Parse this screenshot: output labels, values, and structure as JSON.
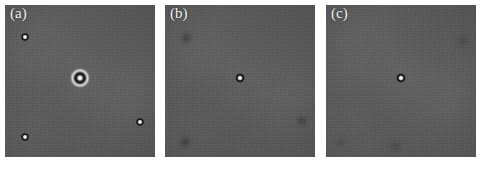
{
  "figure": {
    "type": "micrograph-panel-series",
    "background_color": "#ffffff",
    "panel_count": 3,
    "panel_background_color": "#5b5b5b",
    "label_color": "#f2f2f2"
  },
  "panels": [
    {
      "id": "a",
      "label": "(a)",
      "x": 5,
      "y": 5,
      "width": 150,
      "height": 152,
      "background_color": "#5b5b5b",
      "features": [
        {
          "name": "central-halo-particle",
          "kind": "halo-particle",
          "cx_pct": 50.0,
          "cy_pct": 48.0,
          "size": 22
        },
        {
          "name": "particle-upper-left",
          "kind": "bright-dot",
          "cx_pct": 13.0,
          "cy_pct": 21.0,
          "size": 9
        },
        {
          "name": "particle-lower-left",
          "kind": "bright-dot",
          "cx_pct": 13.0,
          "cy_pct": 87.0,
          "size": 9
        },
        {
          "name": "particle-right-lower",
          "kind": "bright-dot",
          "cx_pct": 90.0,
          "cy_pct": 77.0,
          "size": 9
        }
      ]
    },
    {
      "id": "b",
      "label": "(b)",
      "x": 165,
      "y": 5,
      "width": 150,
      "height": 152,
      "background_color": "#5a5a5a",
      "features": [
        {
          "name": "central-particle",
          "kind": "bright-dot",
          "cx_pct": 50.0,
          "cy_pct": 48.0,
          "size": 10
        },
        {
          "name": "blob-upper-left",
          "kind": "dark-blob",
          "cx_pct": 14.0,
          "cy_pct": 22.0,
          "size": 16
        },
        {
          "name": "blob-lower-left",
          "kind": "dark-blob",
          "cx_pct": 13.0,
          "cy_pct": 90.0,
          "size": 15
        },
        {
          "name": "blob-right-lower",
          "kind": "dark-blob",
          "cx_pct": 91.0,
          "cy_pct": 76.0,
          "size": 14
        }
      ]
    },
    {
      "id": "c",
      "label": "(c)",
      "x": 326,
      "y": 5,
      "width": 150,
      "height": 152,
      "background_color": "#5b5b5b",
      "features": [
        {
          "name": "central-particle",
          "kind": "bright-dot",
          "cx_pct": 50.0,
          "cy_pct": 48.0,
          "size": 10
        },
        {
          "name": "blob-upper-right",
          "kind": "dark-blob-faint",
          "cx_pct": 91.0,
          "cy_pct": 24.0,
          "size": 16
        },
        {
          "name": "blob-bottom-center",
          "kind": "dark-blob-faint",
          "cx_pct": 46.0,
          "cy_pct": 93.0,
          "size": 16
        },
        {
          "name": "blob-lower-left",
          "kind": "dark-blob-faint",
          "cx_pct": 10.0,
          "cy_pct": 90.0,
          "size": 13
        }
      ]
    }
  ]
}
